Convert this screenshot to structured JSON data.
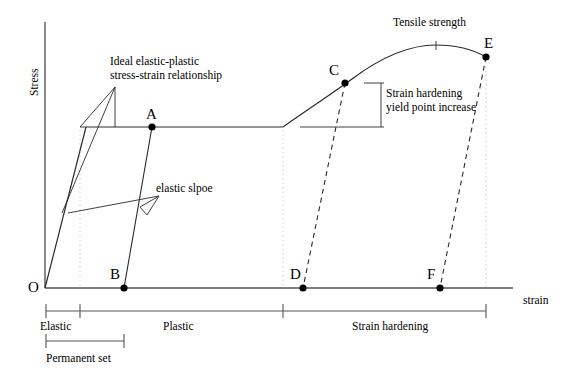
{
  "figure": {
    "type": "stress-strain-diagram",
    "axes": {
      "y_label": "Stress",
      "x_label": "strain",
      "origin_label": "O"
    },
    "points": [
      {
        "id": "O",
        "label": "O",
        "x": 45,
        "y": 288,
        "dot": false
      },
      {
        "id": "A",
        "label": "A",
        "x": 152,
        "y": 127,
        "dot": true
      },
      {
        "id": "B",
        "label": "B",
        "x": 124,
        "y": 288,
        "dot": true
      },
      {
        "id": "C",
        "label": "C",
        "x": 345,
        "y": 83,
        "dot": true
      },
      {
        "id": "D",
        "label": "D",
        "x": 303,
        "y": 288,
        "dot": true
      },
      {
        "id": "E",
        "label": "E",
        "x": 486,
        "y": 57,
        "dot": true
      },
      {
        "id": "F",
        "label": "F",
        "x": 440,
        "y": 288,
        "dot": true
      }
    ],
    "annotations": {
      "ideal_elastic_plastic": "Ideal elastic-plastic\nstress-strain relationship",
      "elastic_slope": "elastic slpoe",
      "tensile_strength": "Tensile strength",
      "strain_hardening_increase": "Strain hardening\nyield point increase"
    },
    "regions": [
      {
        "id": "elastic",
        "label": "Elastic",
        "x_start": 46,
        "x_end": 80
      },
      {
        "id": "plastic",
        "label": "Plastic",
        "x_start": 80,
        "x_end": 283
      },
      {
        "id": "strain-hardening",
        "label": "Strain hardening",
        "x_start": 283,
        "x_end": 486
      },
      {
        "id": "permanent-set",
        "label": "Permanent set",
        "x_start": 46,
        "x_end": 124
      }
    ],
    "colors": {
      "line": "#1a1a1a",
      "axis": "#555555",
      "dotted_guide": "#bbbbbb",
      "background": "#ffffff"
    }
  }
}
